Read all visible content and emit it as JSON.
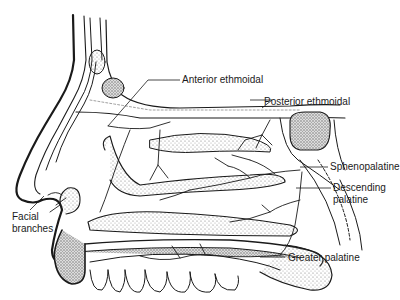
{
  "diagram": {
    "colors": {
      "line": "#1a1a1a",
      "stipple": "#9a9a9a",
      "background": "#ffffff"
    },
    "labels": {
      "anterior_ethmoidal": "Anterior ethmoidal",
      "posterior_ethmoidal": "Posterior ethmoidal",
      "sphenopalatine": "Sphenopalatine",
      "descending_palatine_1": "Descending",
      "descending_palatine_2": "palatine",
      "greater_palatine": "Greater palatine",
      "facial_branches_1": "Facial",
      "facial_branches_2": "branches"
    }
  }
}
